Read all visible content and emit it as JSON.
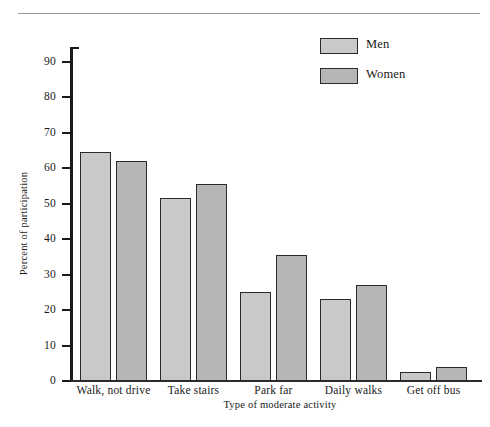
{
  "chart_data": {
    "type": "bar",
    "title": "",
    "xlabel": "Type of moderate activity",
    "ylabel": "Percent of participation",
    "categories": [
      "Walk, not drive",
      "Take stairs",
      "Park far",
      "Daily walks",
      "Get off bus"
    ],
    "series": [
      {
        "name": "Men",
        "color": "#c9c9c9",
        "values": [
          64.5,
          51.5,
          25,
          23,
          2.5
        ]
      },
      {
        "name": "Women",
        "color": "#b6b6b6",
        "values": [
          62,
          55.5,
          35.5,
          27,
          4
        ]
      }
    ],
    "ylim": [
      0,
      95
    ],
    "yticks": [
      0,
      10,
      20,
      30,
      40,
      50,
      60,
      70,
      80,
      90
    ],
    "ytick_labels": [
      "0",
      "10",
      "20",
      "30",
      "40",
      "50",
      "60",
      "70",
      "80",
      "90"
    ],
    "grid": false,
    "legend_position": "top-right",
    "legend_entries": [
      "Men",
      "Women"
    ]
  },
  "axis": {
    "y_title": "Percent of participation",
    "x_title": "Type of moderate activity"
  },
  "legend": {
    "items": [
      {
        "label": "Men"
      },
      {
        "label": "Women"
      }
    ]
  }
}
